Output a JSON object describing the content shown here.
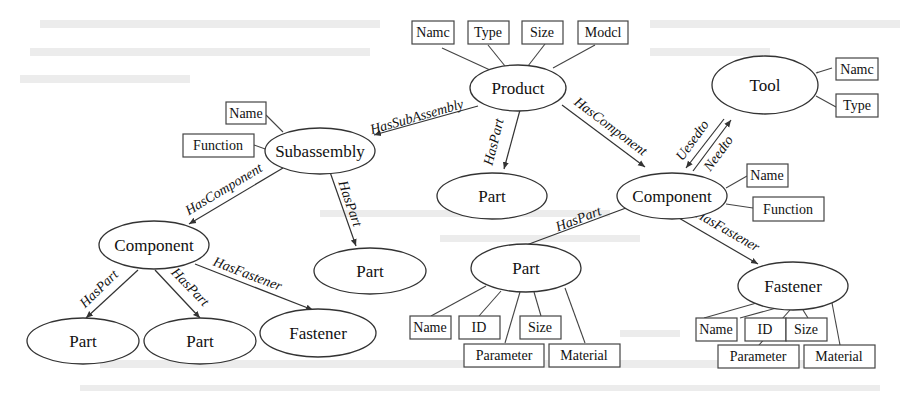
{
  "diagram": {
    "type": "ontology-graph",
    "nodes": {
      "product": {
        "label": "Product"
      },
      "subassembly": {
        "label": "Subassembly"
      },
      "part_center": {
        "label": "Part"
      },
      "component_right": {
        "label": "Component"
      },
      "tool": {
        "label": "Tool"
      },
      "component_left": {
        "label": "Component"
      },
      "part_mid": {
        "label": "Part"
      },
      "part_left1": {
        "label": "Part"
      },
      "part_left2": {
        "label": "Part"
      },
      "fastener_left": {
        "label": "Fastener"
      },
      "part_bottom": {
        "label": "Part"
      },
      "fastener_right": {
        "label": "Fastener"
      }
    },
    "attributes": {
      "product": [
        "Namc",
        "Type",
        "Size",
        "Modcl"
      ],
      "subassembly": [
        "Name",
        "Function"
      ],
      "tool": [
        "Namc",
        "Type"
      ],
      "component_right": [
        "Name",
        "Function"
      ],
      "part_bottom": [
        "Name",
        "ID",
        "Size",
        "Parameter",
        "Material"
      ],
      "fastener_right": [
        "Name",
        "ID",
        "Size",
        "Parameter",
        "Material"
      ]
    },
    "edges": {
      "product_subassembly": "HasSubAssembly",
      "product_part": "HasPart",
      "product_component": "HasComponent",
      "component_tool": "Uesedto",
      "tool_component": "Needto",
      "subassembly_component": "HasComponent",
      "subassembly_part": "HasPart",
      "component_part1": "HasPart",
      "component_part2": "HasPart",
      "component_fastener": "HasFastener",
      "componentR_part": "HasPart",
      "componentR_fastener": "HasFastener"
    }
  }
}
